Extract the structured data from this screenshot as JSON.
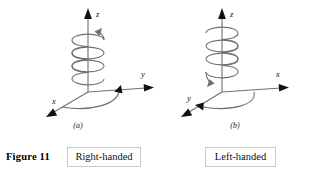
{
  "figure": {
    "number_label": "Figure 11",
    "stroke_color": "#6f6f76",
    "arrow_color": "#111111",
    "box_border_color": "#c9c9c9",
    "background": "#ffffff"
  },
  "panels": [
    {
      "id": "a",
      "sublabel": "(a)",
      "handedness_label": "Right-handed",
      "axes": [
        {
          "name": "z",
          "label": "z",
          "direction": "up"
        },
        {
          "name": "y",
          "label": "y",
          "direction": "right"
        },
        {
          "name": "x",
          "label": "x",
          "direction": "down-left"
        }
      ],
      "helix": {
        "turns": 3,
        "arrow_position": "top-right",
        "rotation_sense": "counterclockwise-from-above"
      },
      "ground_arc": {
        "from_axis": "x",
        "to_axis": "y",
        "arrow_position": "right"
      }
    },
    {
      "id": "b",
      "sublabel": "(b)",
      "handedness_label": "Left-handed",
      "axes": [
        {
          "name": "z",
          "label": "z",
          "direction": "up"
        },
        {
          "name": "x",
          "label": "x",
          "direction": "right"
        },
        {
          "name": "y",
          "label": "y",
          "direction": "down-left"
        }
      ],
      "helix": {
        "turns": 3,
        "arrow_position": "bottom-left",
        "rotation_sense": "clockwise-from-above"
      },
      "ground_arc": {
        "from_axis": "x",
        "to_axis": "y",
        "arrow_position": "left"
      }
    }
  ]
}
